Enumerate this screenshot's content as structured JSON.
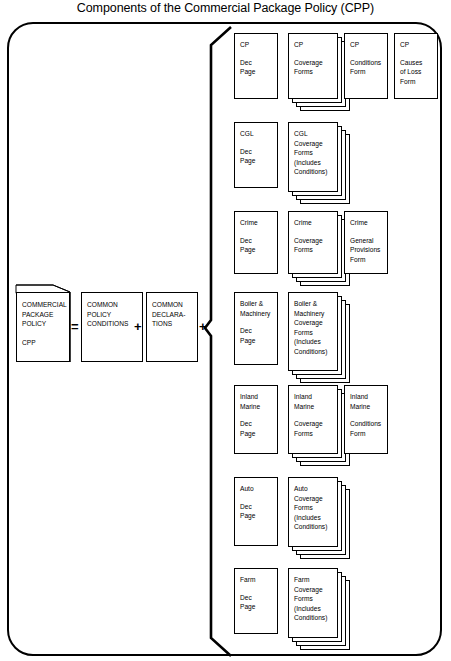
{
  "title": "Components of the Commercial Package Policy (CPP)",
  "equation": {
    "policy_box": {
      "lines": [
        "COMMERCIAL",
        "PACKAGE",
        "POLICY"
      ],
      "abbrev": "CPP"
    },
    "equals": "=",
    "conditions_box": {
      "lines": [
        "COMMON",
        "POLICY",
        "CONDITIONS"
      ]
    },
    "plus1": "+",
    "declarations_box": {
      "lines": [
        "COMMON",
        "DECLARA-",
        "TIONS"
      ]
    },
    "plus2": "+"
  },
  "lines_of_business": [
    {
      "key": "cp",
      "dec": {
        "lines": [
          "CP",
          "",
          "Dec",
          "Page"
        ]
      },
      "coverage": {
        "lines": [
          "CP",
          "",
          "Coverage",
          "Forms"
        ],
        "stacked": true
      },
      "extras": [
        {
          "lines": [
            "CP",
            "",
            "Conditions",
            "Form"
          ]
        },
        {
          "lines": [
            "CP",
            "",
            "Causes",
            "of Loss",
            "Form"
          ]
        }
      ]
    },
    {
      "key": "cgl",
      "dec": {
        "lines": [
          "CGL",
          "",
          "Dec",
          "Page"
        ]
      },
      "coverage": {
        "lines": [
          "CGL",
          "Coverage",
          "Forms",
          "(Includes",
          "Conditions)"
        ],
        "stacked": true
      },
      "extras": []
    },
    {
      "key": "crime",
      "dec": {
        "lines": [
          "Crime",
          "",
          "Dec",
          "Page"
        ]
      },
      "coverage": {
        "lines": [
          "Crime",
          "",
          "Coverage",
          "Forms"
        ],
        "stacked": true
      },
      "extras": [
        {
          "lines": [
            "Crime",
            "",
            "General",
            "Provisions",
            "Form"
          ]
        }
      ]
    },
    {
      "key": "boiler",
      "dec": {
        "lines": [
          "Boiler &",
          "Machinery",
          "",
          "Dec",
          "Page"
        ]
      },
      "coverage": {
        "lines": [
          "Boiler &",
          "Machinery",
          "Coverage",
          "Forms",
          "(Includes",
          "Conditions)"
        ],
        "stacked": true
      },
      "extras": []
    },
    {
      "key": "inland-marine",
      "dec": {
        "lines": [
          "Inland",
          "Marine",
          "",
          "Dec",
          "Page"
        ]
      },
      "coverage": {
        "lines": [
          "Inland",
          "Marine",
          "",
          "Coverage",
          "Forms"
        ],
        "stacked": true
      },
      "extras": [
        {
          "lines": [
            "Inland",
            "Marine",
            "",
            "Conditions",
            "Form"
          ]
        }
      ]
    },
    {
      "key": "auto",
      "dec": {
        "lines": [
          "Auto",
          "",
          "Dec",
          "Page"
        ]
      },
      "coverage": {
        "lines": [
          "Auto",
          "Coverage",
          "Forms",
          "(Includes",
          "Conditions)"
        ],
        "stacked": true
      },
      "extras": []
    },
    {
      "key": "farm",
      "dec": {
        "lines": [
          "Farm",
          "",
          "Dec",
          "Page"
        ]
      },
      "coverage": {
        "lines": [
          "Farm",
          "Coverage",
          "Forms",
          "(Includes",
          "Conditions)"
        ],
        "stacked": true
      },
      "extras": []
    }
  ],
  "colors": {
    "stroke": "#000000",
    "background": "#ffffff"
  }
}
